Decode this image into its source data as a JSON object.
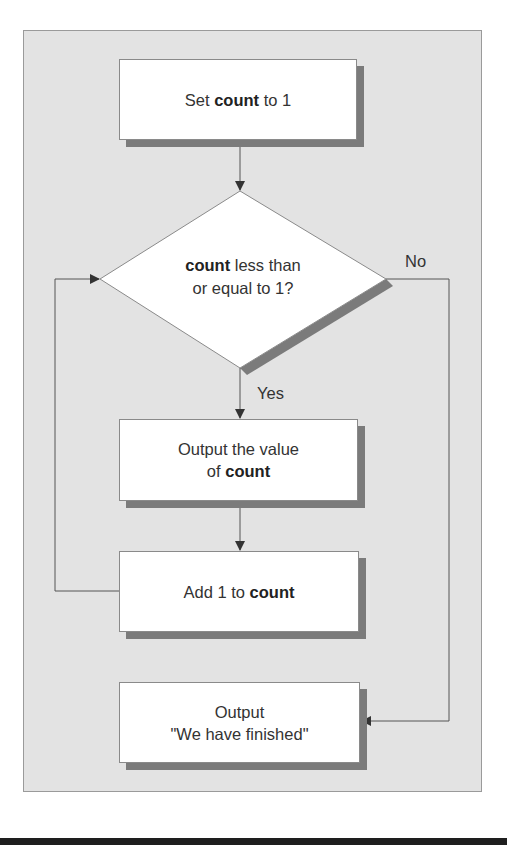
{
  "diagram": {
    "type": "flowchart",
    "nodes": {
      "start": {
        "shape": "process",
        "parts": [
          "Set ",
          "count",
          " to 1"
        ]
      },
      "decision": {
        "shape": "decision",
        "line1": [
          "count",
          " less than"
        ],
        "line2": "or equal to 1?"
      },
      "output_value": {
        "shape": "process",
        "line1": "Output the value",
        "line2": [
          "of ",
          "count"
        ]
      },
      "increment": {
        "shape": "process",
        "parts": [
          "Add 1 to ",
          "count"
        ]
      },
      "finish": {
        "shape": "process",
        "line1": "Output",
        "line2": "\"We have finished\""
      }
    },
    "edge_labels": {
      "yes": "Yes",
      "no": "No"
    },
    "edges": [
      {
        "from": "start",
        "to": "decision"
      },
      {
        "from": "decision",
        "to": "output_value",
        "label": "Yes"
      },
      {
        "from": "output_value",
        "to": "increment"
      },
      {
        "from": "increment",
        "to": "decision",
        "note": "loop back"
      },
      {
        "from": "decision",
        "to": "finish",
        "label": "No"
      }
    ],
    "colors": {
      "panel": "#e3e3e3",
      "box": "#ffffff",
      "shadow": "#7b7b7b",
      "line": "#555555",
      "arrow": "#333333"
    }
  }
}
